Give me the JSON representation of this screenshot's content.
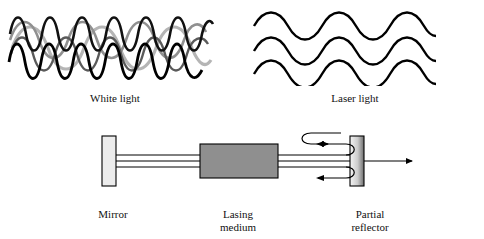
{
  "figure": {
    "title": "",
    "panels": {
      "white_light": {
        "label": "White light",
        "description": "multiple overlapping sine waves of differing phase, amplitude and shade",
        "wave_count": 5,
        "colors": [
          "#000000",
          "#222222",
          "#555555",
          "#888888",
          "#aaaaaa"
        ]
      },
      "laser_light": {
        "label": "Laser light",
        "description": "three identical in-phase sine waves stacked vertically",
        "wave_count": 3,
        "colors": [
          "#000000",
          "#000000",
          "#000000"
        ]
      },
      "cavity": {
        "mirror_label": "Mirror",
        "medium_label": "Lasing\nmedium",
        "medium_label_line1": "Lasing",
        "medium_label_line2": "medium",
        "reflector_label": "Partial\nreflector",
        "reflector_label_line1": "Partial",
        "reflector_label_line2": "reflector",
        "mirror_fill": "#e8e8e8",
        "medium_fill": "#8f8f8f",
        "reflector_fill_left": "#f2f2f2",
        "reflector_fill_right": "#6e6e6e",
        "beam_color": "#000000"
      }
    },
    "colors": {
      "background": "#ffffff",
      "stroke": "#000000",
      "text": "#111111"
    }
  }
}
